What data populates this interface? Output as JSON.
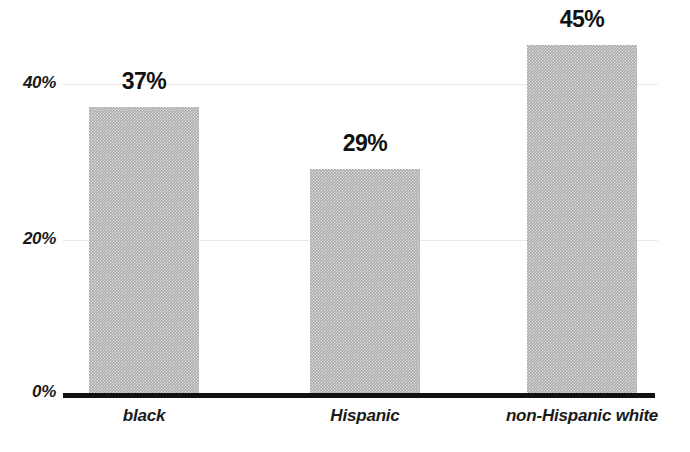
{
  "chart_data": {
    "type": "bar",
    "title": "",
    "subtitle": "",
    "xlabel": "",
    "ylabel": "",
    "categories": [
      "black",
      "Hispanic",
      "non-Hispanic white"
    ],
    "values": [
      37,
      29,
      45
    ],
    "value_labels": [
      "37%",
      "29%",
      "45%"
    ],
    "ylim": [
      0,
      50
    ],
    "yticks": [
      0,
      20,
      40
    ],
    "ytick_labels": [
      "0%",
      "20%",
      "40%"
    ],
    "grid": true,
    "grid_axis": "y",
    "legend": false,
    "legend_position": "none",
    "annotations": [],
    "series": [
      {
        "name": "",
        "values": [
          37,
          29,
          45
        ]
      }
    ],
    "colors": {
      "bar_fill": "#ababab",
      "axis": "#111111",
      "gridline": "#e9e9e9",
      "text": "#1a1a1a",
      "background": "#ffffff"
    }
  },
  "axes": {
    "y": {
      "ticks": [
        {
          "label": "40%",
          "value": 40
        },
        {
          "label": "20%",
          "value": 20
        },
        {
          "label": "0%",
          "value": 0
        }
      ]
    },
    "x": {
      "ticks": [
        {
          "label": "black"
        },
        {
          "label": "Hispanic"
        },
        {
          "label": "non-Hispanic white"
        }
      ]
    }
  }
}
